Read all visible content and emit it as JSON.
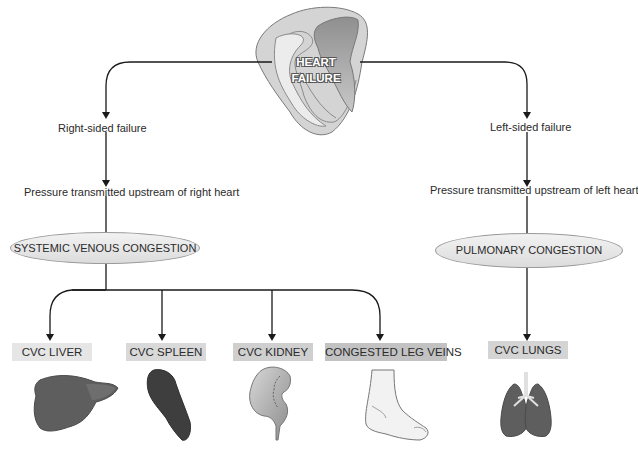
{
  "title": "HEART FAILURE",
  "branches": {
    "right": {
      "label": "Right-sided failure",
      "pressure": "Pressure transmitted upstream of right heart",
      "congestion": "SYSTEMIC VENOUS CONGESTION",
      "outcomes": [
        {
          "label": "CVC LIVER",
          "organ": "liver",
          "color": "#e6e6e6"
        },
        {
          "label": "CVC SPLEEN",
          "organ": "spleen",
          "color": "#d9d9d9"
        },
        {
          "label": "CVC KIDNEY",
          "organ": "kidney",
          "color": "#cfcfcf"
        },
        {
          "label": "CONGESTED LEG VEINS",
          "organ": "foot",
          "color": "#c2c2c2"
        }
      ]
    },
    "left": {
      "label": "Left-sided failure",
      "pressure": "Pressure transmitted upstream of left heart",
      "congestion": "PULMONARY CONGESTION",
      "outcomes": [
        {
          "label": "CVC LUNGS",
          "organ": "lungs",
          "color": "#d4d4d4"
        }
      ]
    }
  },
  "colors": {
    "line": "#1a1a1a",
    "heart_outer": "#d2d2d2",
    "heart_inner": "#ededed",
    "heart_chamber": "#9a9a9a",
    "organ_dark": "#4a4a4a",
    "organ_mid": "#6a6a6a"
  }
}
